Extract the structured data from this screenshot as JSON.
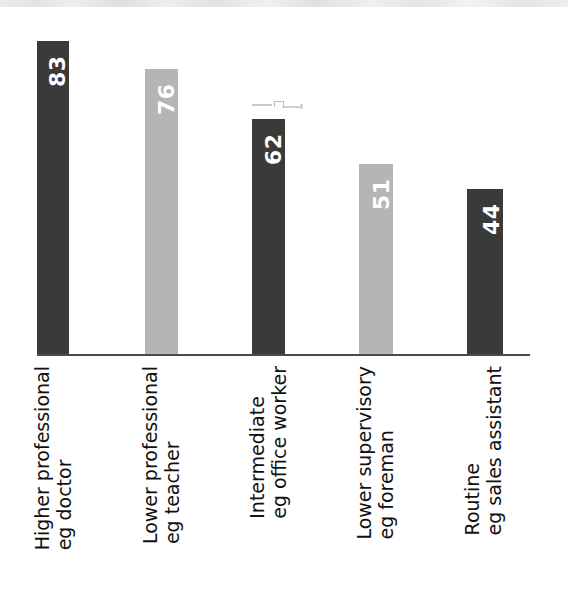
{
  "chart_data": {
    "type": "bar",
    "title": "",
    "subtitle": "",
    "xlabel": "",
    "ylabel": "",
    "grid": false,
    "legend": "none",
    "ylim": [
      0,
      90
    ],
    "orientation": "vertical",
    "label_rotation": "90deg-bottom-to-top",
    "categories": [
      "Higher professional\neg doctor",
      "Lower professional\neg teacher",
      "Intermediate\neg office worker",
      "Lower supervisory\neg foreman",
      "Routine\neg sales assistant"
    ],
    "values": [
      83,
      76,
      62,
      51,
      44
    ],
    "bar_colors": [
      "#3a3a3a",
      "#b5b5b5",
      "#3a3a3a",
      "#b5b5b5",
      "#3a3a3a"
    ],
    "value_label_color": "#ffffff",
    "axis_color": "#4a4a4a",
    "background": "#ffffff"
  },
  "bars": [
    {
      "label_line1": "Higher professional",
      "label_line2": "eg doctor",
      "label_text": "Higher professional\neg doctor",
      "value": "83",
      "color": "#3a3a3a",
      "x": 37,
      "width": 32,
      "height": 315
    },
    {
      "label_line1": "Lower professional",
      "label_line2": "eg teacher",
      "label_text": "Lower professional\neg teacher",
      "value": "76",
      "color": "#b5b5b5",
      "x": 145,
      "width": 33,
      "height": 287
    },
    {
      "label_line1": "Intermediate",
      "label_line2": "eg office worker",
      "label_text": "Intermediate\neg office worker",
      "value": "62",
      "color": "#3a3a3a",
      "x": 252,
      "width": 33,
      "height": 237
    },
    {
      "label_line1": "Lower supervisory",
      "label_line2": "eg foreman",
      "label_text": "Lower supervisory\neg foreman",
      "value": "51",
      "color": "#b5b5b5",
      "x": 359,
      "width": 34,
      "height": 192
    },
    {
      "label_line1": "Routine",
      "label_line2": "eg sales assistant",
      "label_text": "Routine\neg sales assistant",
      "value": "44",
      "color": "#3a3a3a",
      "x": 467,
      "width": 36,
      "height": 167
    }
  ]
}
